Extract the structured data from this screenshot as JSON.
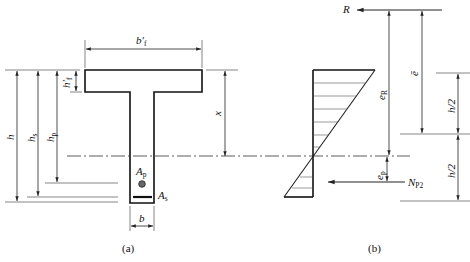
{
  "figure": {
    "panel_a": {
      "caption": "(a)",
      "labels": {
        "b_f_prime": "b′",
        "b_f_prime_sub": "f",
        "h_f_prime": "h′",
        "h_f_prime_sub": "f",
        "h": "h",
        "h_s": "h",
        "h_s_sub": "s",
        "h_p": "h",
        "h_p_sub": "p",
        "x": "x",
        "A_p": "A",
        "A_p_sub": "p",
        "A_s": "A",
        "A_s_sub": "s",
        "b": "b"
      }
    },
    "panel_b": {
      "caption": "(b)",
      "labels": {
        "R": "R",
        "e_R": "e",
        "e_R_sub": "R",
        "e_bar": "ē",
        "h_half_top": "h/2",
        "h_half_bottom": "h/2",
        "e_p": "e",
        "e_p_sub": "p",
        "N_P2": "N",
        "N_P2_sub": "P2"
      }
    }
  }
}
